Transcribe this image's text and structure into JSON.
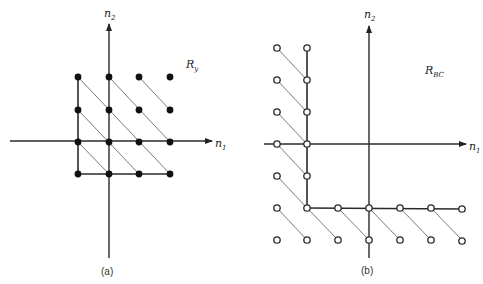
{
  "figures": [
    {
      "id": "a",
      "caption": "(a)",
      "region_label": {
        "main": "R",
        "sub": "y"
      },
      "axes": {
        "x_label": {
          "main": "n",
          "sub": "1"
        },
        "y_label": {
          "main": "n",
          "sub": "2"
        }
      },
      "marker": "filled",
      "columns_px": [
        78,
        109,
        139,
        170
      ],
      "rows_px": [
        77,
        110,
        142,
        174
      ],
      "points_grid": [
        [
          0,
          0
        ],
        [
          1,
          0
        ],
        [
          2,
          0
        ],
        [
          3,
          0
        ],
        [
          0,
          1
        ],
        [
          1,
          1
        ],
        [
          2,
          1
        ],
        [
          3,
          1
        ],
        [
          0,
          2
        ],
        [
          1,
          2
        ],
        [
          2,
          2
        ],
        [
          3,
          2
        ],
        [
          0,
          3
        ],
        [
          1,
          3
        ],
        [
          2,
          3
        ],
        [
          3,
          3
        ]
      ],
      "diagonals_grid": [
        [
          [
            0,
            0
          ],
          [
            3,
            3
          ]
        ],
        [
          [
            1,
            0
          ],
          [
            3,
            2
          ]
        ],
        [
          [
            2,
            0
          ],
          [
            3,
            1
          ]
        ],
        [
          [
            0,
            1
          ],
          [
            2,
            3
          ]
        ],
        [
          [
            0,
            2
          ],
          [
            1,
            3
          ]
        ]
      ],
      "boundary": "left column and bottom row"
    },
    {
      "id": "b",
      "caption": "(b)",
      "region_label": {
        "main": "R",
        "sub": "BC"
      },
      "axes": {
        "x_label": {
          "main": "n",
          "sub": "1"
        },
        "y_label": {
          "main": "n",
          "sub": "2"
        }
      },
      "marker": "open",
      "columns_px": [
        277,
        307,
        338,
        368,
        400,
        431,
        462
      ],
      "rows_px": [
        48,
        80,
        112,
        144,
        176,
        208,
        240
      ],
      "boundary": "vertical at n1=-2 from top to n2=-2, horizontal at n2=-2 to right"
    }
  ]
}
